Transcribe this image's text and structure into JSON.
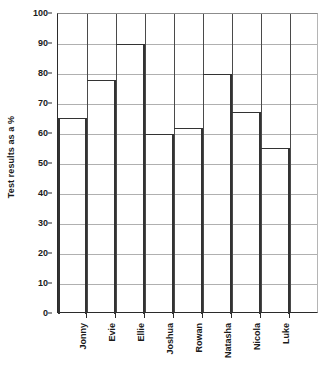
{
  "chart_data": {
    "type": "bar",
    "title": "",
    "xlabel": "",
    "ylabel": "Test results as a %",
    "categories": [
      "Jonny",
      "Evie",
      "Ellie",
      "Joshua",
      "Rowan",
      "Natasha",
      "Nicola",
      "Luke"
    ],
    "values": [
      65.5,
      78,
      90,
      60,
      62,
      80,
      67.5,
      55.5
    ],
    "ylim": [
      0,
      100
    ],
    "ytick_step": 10,
    "yticks": [
      0,
      10,
      20,
      30,
      40,
      50,
      60,
      70,
      80,
      90,
      100
    ],
    "ytick_labels": [
      "0",
      "10",
      "20",
      "30",
      "40",
      "50",
      "60",
      "70",
      "80",
      "90",
      "100"
    ],
    "grid": "horizontal-and-vertical",
    "legend": "none",
    "bar_style": "outline",
    "empty_trailing_column": true,
    "colors": {
      "bar_outline": "#333333",
      "gridline": "#b0b0b0",
      "column_divider": "#4a4a4a",
      "axis": "#2b2b2b",
      "text": "#1a1a1a",
      "background": "#ffffff"
    }
  }
}
